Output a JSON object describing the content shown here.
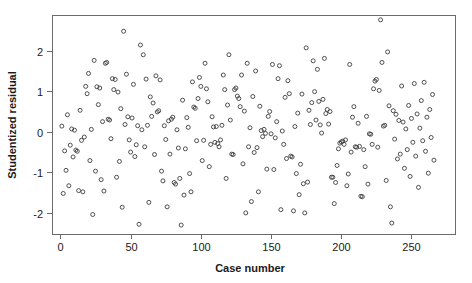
{
  "chart_data": {
    "type": "scatter",
    "title": "",
    "xlabel": "Case number",
    "ylabel": "Studentized residual",
    "xlim": [
      -6,
      281
    ],
    "ylim": [
      -2.52,
      2.88
    ],
    "grid": false,
    "legend": null,
    "xticks": [
      0,
      50,
      100,
      150,
      200,
      250
    ],
    "xtick_labels": [
      "0",
      "50",
      "100",
      "150",
      "200",
      "250"
    ],
    "yticks": [
      -2,
      -1,
      0,
      1,
      2
    ],
    "ytick_labels": [
      "-2",
      "-1",
      "0",
      "1",
      "2"
    ],
    "marker": "open-circle",
    "marker_color": "#3d3d3d",
    "marker_size": 4,
    "n_points": 278,
    "x": [
      1,
      2,
      3,
      4,
      5,
      6,
      7,
      8,
      9,
      10,
      11,
      12,
      13,
      14,
      15,
      16,
      17,
      18,
      19,
      20,
      21,
      22,
      23,
      24,
      25,
      26,
      27,
      28,
      29,
      30,
      31,
      32,
      33,
      34,
      35,
      36,
      37,
      38,
      39,
      40,
      41,
      42,
      43,
      44,
      45,
      46,
      47,
      48,
      49,
      50,
      51,
      52,
      53,
      54,
      55,
      56,
      57,
      58,
      59,
      60,
      61,
      62,
      63,
      64,
      65,
      66,
      67,
      68,
      69,
      70,
      71,
      72,
      73,
      74,
      75,
      76,
      77,
      78,
      79,
      80,
      81,
      82,
      83,
      84,
      85,
      86,
      87,
      88,
      89,
      90,
      91,
      92,
      93,
      94,
      95,
      96,
      97,
      98,
      99,
      100,
      101,
      102,
      103,
      104,
      105,
      106,
      107,
      108,
      109,
      110,
      111,
      112,
      113,
      114,
      115,
      116,
      117,
      118,
      119,
      120,
      121,
      122,
      123,
      124,
      125,
      126,
      127,
      128,
      129,
      130,
      131,
      132,
      133,
      134,
      135,
      136,
      137,
      138,
      139,
      140,
      141,
      142,
      143,
      144,
      145,
      146,
      147,
      148,
      149,
      150,
      151,
      152,
      153,
      154,
      155,
      156,
      157,
      158,
      159,
      160,
      161,
      162,
      163,
      164,
      165,
      166,
      167,
      168,
      169,
      170,
      171,
      172,
      173,
      174,
      175,
      176,
      177,
      178,
      179,
      180,
      181,
      182,
      183,
      184,
      185,
      186,
      187,
      188,
      189,
      190,
      191,
      192,
      193,
      194,
      195,
      196,
      197,
      198,
      199,
      200,
      201,
      202,
      203,
      204,
      205,
      206,
      207,
      208,
      209,
      210,
      211,
      212,
      213,
      214,
      215,
      216,
      217,
      218,
      219,
      220,
      221,
      222,
      223,
      224,
      225,
      226,
      227,
      228,
      229,
      230,
      231,
      232,
      233,
      234,
      235,
      236,
      237,
      238,
      239,
      240,
      241,
      242,
      243,
      244,
      245,
      246,
      247,
      248,
      249,
      250,
      251,
      252,
      253,
      254,
      255,
      256,
      257,
      258,
      259,
      260,
      261,
      262,
      263,
      264,
      265,
      266,
      267,
      268,
      269,
      270,
      271,
      272,
      273,
      274,
      275,
      276,
      277,
      278
    ],
    "y": [
      0.14,
      -1.52,
      -0.47,
      -0.95,
      0.42,
      -1.33,
      -0.33,
      0.07,
      -0.62,
      0.04,
      -0.45,
      -0.48,
      -1.45,
      0.53,
      -0.21,
      -1.48,
      -0.13,
      1.12,
      0.94,
      1.44,
      -0.71,
      0.06,
      -2.04,
      1.76,
      -0.97,
      1.11,
      0.67,
      1.08,
      -1.18,
      0.25,
      -1.46,
      1.69,
      1.71,
      0.31,
      0.29,
      -0.17,
      1.31,
      1.04,
      1.29,
      -1.12,
      0.98,
      -0.73,
      0.57,
      -1.86,
      2.48,
      0.18,
      1.42,
      0.37,
      -0.2,
      -0.5,
      0.34,
      1.17,
      -0.61,
      -0.32,
      0.15,
      -2.28,
      2.14,
      0.05,
      1.9,
      -0.37,
      1.3,
      0.16,
      -1.74,
      0.86,
      0.38,
      0.71,
      -0.56,
      1.38,
      0.49,
      0.52,
      1.28,
      -0.97,
      -1.21,
      0.15,
      -0.19,
      -1.85,
      0.27,
      -0.55,
      0.31,
      0.36,
      -1.25,
      -1.29,
      0.05,
      -0.4,
      -1.15,
      -2.3,
      0.78,
      -1.56,
      -0.42,
      0.35,
      0.11,
      -1.03,
      -1.48,
      1.23,
      0.61,
      0.58,
      -0.22,
      0.82,
      1.34,
      1.12,
      -0.71,
      -0.21,
      1.69,
      1.06,
      0.74,
      -0.86,
      -0.31,
      0.37,
      0.12,
      -0.26,
      0.13,
      -0.29,
      -0.37,
      -0.2,
      0.16,
      1.4,
      1.04,
      -1.15,
      0.66,
      1.9,
      0.29,
      -0.55,
      -0.56,
      1.04,
      1.08,
      0.88,
      0.82,
      0.62,
      1.4,
      -0.79,
      0.51,
      -2.0,
      1.69,
      -0.37,
      0.1,
      -1.72,
      0.87,
      -0.51,
      1.5,
      -0.39,
      -1.48,
      0.63,
      0.03,
      -0.12,
      0.06,
      -0.04,
      -0.92,
      0.38,
      0.5,
      -0.05,
      1.66,
      -0.93,
      -0.15,
      0.25,
      1.31,
      1.63,
      -1.92,
      0.02,
      -0.31,
      0.85,
      -0.66,
      1.26,
      0.94,
      -0.6,
      -0.62,
      -1.95,
      0.13,
      -1.03,
      0.46,
      -1.55,
      -0.8,
      0.93,
      -1.28,
      -2.0,
      2.07,
      -1.24,
      0.53,
      0.18,
      0.72,
      1.75,
      0.99,
      0.29,
      1.54,
      0.75,
      0.17,
      -0.03,
      0.8,
      1.81,
      0.45,
      0.55,
      0.19,
      0.5,
      -1.12,
      -1.12,
      -1.77,
      -1.25,
      -0.83,
      -0.42,
      -0.28,
      -0.25,
      -0.23,
      -0.31,
      -0.2,
      -1.33,
      -1.04,
      1.66,
      -0.5,
      0.36,
      0.62,
      -0.37,
      -0.38,
      0.21,
      -0.36,
      -1.59,
      -1.6,
      -0.44,
      -0.86,
      0.38,
      -1.29,
      -0.05,
      -0.06,
      -0.31,
      1.06,
      1.25,
      1.29,
      -0.38,
      1.02,
      2.76,
      1.71,
      0.14,
      0.16,
      -1.2,
      1.97,
      0.64,
      -1.85,
      -2.25,
      0.52,
      -0.18,
      0.43,
      -0.67,
      0.28,
      -0.55,
      1.13,
      0.24,
      -0.9,
      0.07,
      -0.44,
      0.65,
      -1.1,
      0.33,
      -0.26,
      1.19,
      -0.6,
      0.44,
      -1.37,
      0.09,
      0.77,
      -0.22,
      1.22,
      -0.48,
      0.36,
      -1.02,
      0.55,
      -0.14,
      0.92,
      -0.7
    ]
  }
}
